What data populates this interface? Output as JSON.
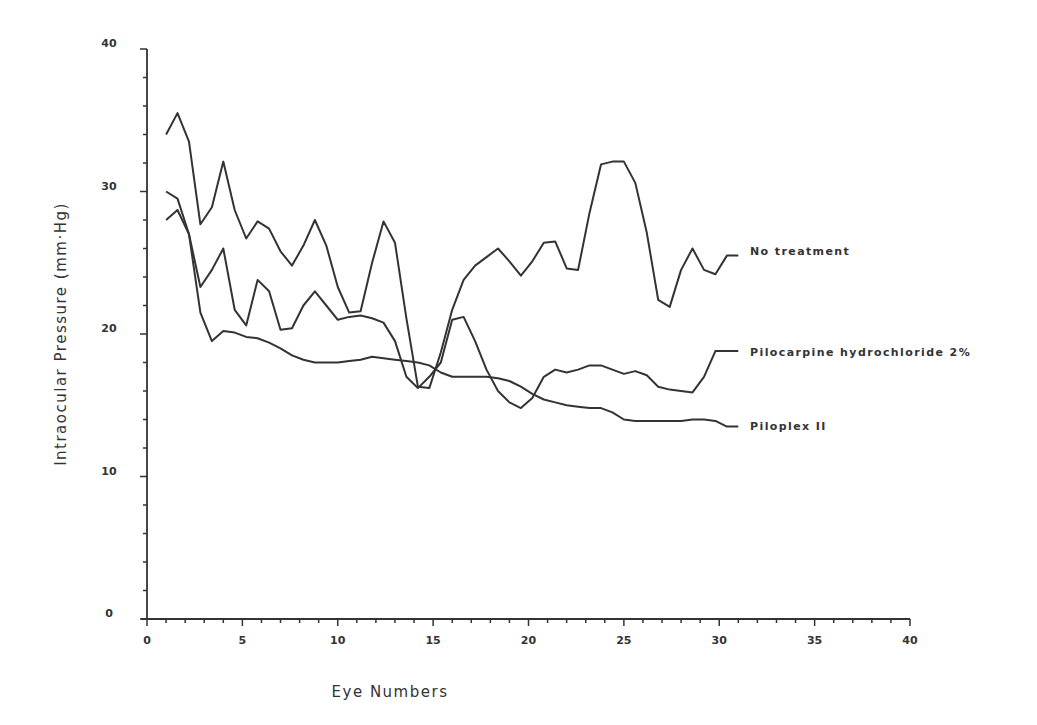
{
  "chart_data": {
    "type": "line",
    "title": "",
    "xlabel": "Eye Numbers",
    "ylabel": "Intraocular Pressure (mm·Hg)",
    "xlim": [
      0,
      40
    ],
    "ylim": [
      0,
      40
    ],
    "xticks": [
      0,
      5,
      10,
      15,
      20,
      25,
      30,
      35,
      40
    ],
    "xtick_labels": [
      "0",
      "5",
      "10",
      "15",
      "20",
      "25",
      "30",
      "35",
      "40"
    ],
    "yticks": [
      0,
      10,
      20,
      30,
      40
    ],
    "ytick_labels": [
      "0",
      "10",
      "20",
      "30",
      "40"
    ],
    "x_minor_step": 1,
    "y_minor_step": 2,
    "grid": false,
    "legend_position": "inline-right-of-line-ends",
    "x": [
      1.0,
      1.6,
      2.2,
      2.8,
      3.4,
      4.0,
      4.6,
      5.2,
      5.8,
      6.4,
      7.0,
      7.6,
      8.2,
      8.8,
      9.4,
      10.0,
      10.6,
      11.2,
      11.8,
      12.4,
      13.0,
      13.6,
      14.2,
      14.8,
      15.4,
      16.0,
      16.6,
      17.2,
      17.8,
      18.4,
      19.0,
      19.6,
      20.2,
      20.8,
      21.4,
      22.0,
      22.6,
      23.2,
      23.8,
      24.4,
      25.0,
      25.6,
      26.2,
      26.8,
      27.4,
      28.0,
      28.6,
      29.2,
      29.8,
      30.4,
      31.0
    ],
    "series": [
      {
        "name": "No treatment",
        "values": [
          34.0,
          35.5,
          33.5,
          27.7,
          28.9,
          32.1,
          28.7,
          26.7,
          27.9,
          27.4,
          25.8,
          24.8,
          26.2,
          28.0,
          26.2,
          23.3,
          21.5,
          21.6,
          25.0,
          27.9,
          26.4,
          21.1,
          16.3,
          16.2,
          18.7,
          21.7,
          23.8,
          24.8,
          25.4,
          26.0,
          25.1,
          24.1,
          25.1,
          26.4,
          26.5,
          24.6,
          24.5,
          28.5,
          31.9,
          32.1,
          32.1,
          30.6,
          27.1,
          22.4,
          21.9,
          24.5,
          26.0,
          24.5,
          24.2,
          25.5,
          25.5
        ]
      },
      {
        "name": "Pilocarpine hydrochloride 2%",
        "values": [
          28.0,
          28.7,
          27.0,
          23.3,
          24.5,
          26.0,
          21.7,
          20.6,
          23.8,
          23.0,
          20.3,
          20.4,
          22.0,
          23.0,
          22.0,
          21.0,
          21.2,
          21.3,
          21.1,
          20.8,
          19.5,
          17.0,
          16.2,
          17.0,
          18.0,
          21.0,
          21.2,
          19.5,
          17.5,
          16.0,
          15.2,
          14.8,
          15.5,
          17.0,
          17.5,
          17.3,
          17.5,
          17.8,
          17.8,
          17.5,
          17.2,
          17.4,
          17.1,
          16.3,
          16.1,
          16.0,
          15.9,
          17.0,
          18.8,
          18.8,
          18.8
        ]
      },
      {
        "name": "Piloplex II",
        "values": [
          30.0,
          29.5,
          27.0,
          21.5,
          19.5,
          20.2,
          20.1,
          19.8,
          19.7,
          19.4,
          19.0,
          18.5,
          18.2,
          18.0,
          18.0,
          18.0,
          18.1,
          18.2,
          18.4,
          18.3,
          18.2,
          18.1,
          18.0,
          17.8,
          17.3,
          17.0,
          17.0,
          17.0,
          17.0,
          16.9,
          16.7,
          16.3,
          15.8,
          15.4,
          15.2,
          15.0,
          14.9,
          14.8,
          14.8,
          14.5,
          14.0,
          13.9,
          13.9,
          13.9,
          13.9,
          13.9,
          14.0,
          14.0,
          13.9,
          13.5,
          13.5
        ]
      }
    ]
  },
  "legend": {
    "items": [
      {
        "label": "No treatment",
        "y_px": 251
      },
      {
        "label": "Pilocarpine hydrochloride 2%",
        "y_px": 352
      },
      {
        "label": "Piloplex II",
        "y_px": 426
      }
    ]
  },
  "colors": {
    "line": "#333333",
    "background": "#ffffff"
  }
}
